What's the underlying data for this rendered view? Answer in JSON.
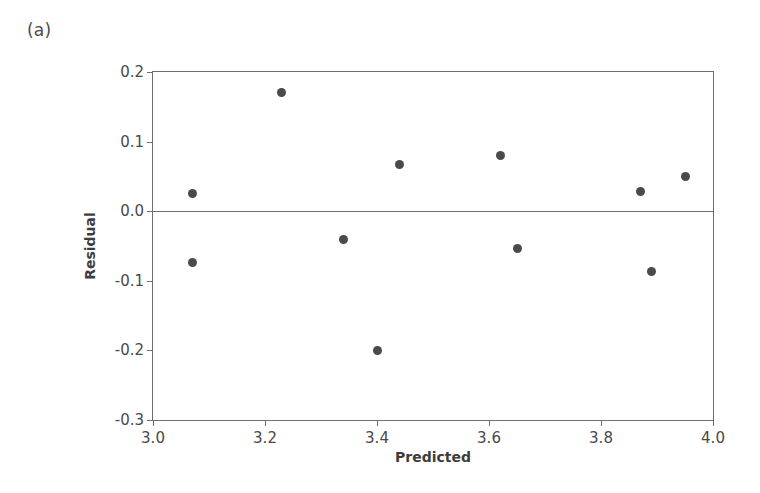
{
  "panel": {
    "label": "(a)"
  },
  "chart_data": {
    "type": "scatter",
    "title": "",
    "subtitle": "",
    "xlabel": "Predicted",
    "ylabel": "Residual",
    "xlim": [
      3.0,
      4.0
    ],
    "ylim": [
      -0.3,
      0.2
    ],
    "xticks": [
      "3.0",
      "3.2",
      "3.4",
      "3.6",
      "3.8",
      "4.0"
    ],
    "xtick_values": [
      3.0,
      3.2,
      3.4,
      3.6,
      3.8,
      4.0
    ],
    "yticks": [
      "0.2",
      "0.1",
      "0.0",
      "-0.1",
      "-0.2",
      "-0.3"
    ],
    "ytick_values": [
      0.2,
      0.1,
      0.0,
      -0.1,
      -0.2,
      -0.3
    ],
    "grid": false,
    "legend": "none",
    "reference_line": {
      "axis": "y",
      "value": 0.0
    },
    "marker_color": "#4a4a4a",
    "axis_color": "#6f6f6f",
    "points": [
      {
        "x": 3.07,
        "y": 0.025
      },
      {
        "x": 3.07,
        "y": -0.073
      },
      {
        "x": 3.23,
        "y": 0.17
      },
      {
        "x": 3.34,
        "y": -0.04
      },
      {
        "x": 3.4,
        "y": -0.2
      },
      {
        "x": 3.44,
        "y": 0.067
      },
      {
        "x": 3.62,
        "y": 0.08
      },
      {
        "x": 3.65,
        "y": -0.053
      },
      {
        "x": 3.87,
        "y": 0.029
      },
      {
        "x": 3.89,
        "y": -0.086
      },
      {
        "x": 3.95,
        "y": 0.05
      }
    ]
  }
}
